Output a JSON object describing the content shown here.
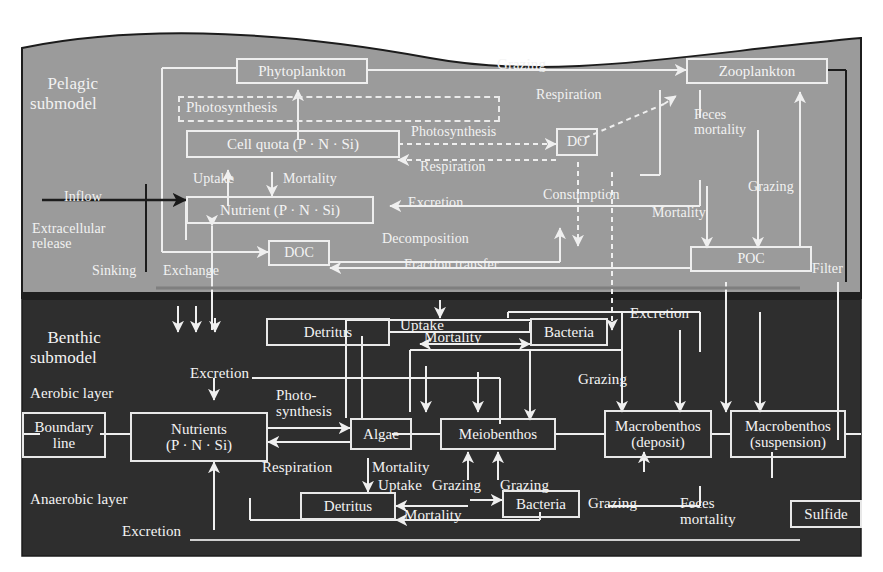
{
  "figure": {
    "type": "ecosystem-box-and-arrow-diagram",
    "background_color": "#ffffff",
    "pelagic_fill": "#999999",
    "benthic_fill": "#2e2e2e",
    "line_color": "#eeeeee"
  },
  "sections": {
    "pelagic": {
      "title": "Pelagic\nsubmodel"
    },
    "benthic": {
      "title": "Benthic\nsubmodel"
    },
    "aerobic": {
      "label": "Aerobic layer"
    },
    "anaerobic": {
      "label": "Anaerobic layer"
    }
  },
  "pelagic": {
    "boxes": {
      "phytoplankton": "Phytoplankton",
      "cell_quota": "Cell quota (P · N · Si)",
      "nutrient": "Nutrient (P · N · Si)",
      "zooplankton": "Zooplankton",
      "do": "DO",
      "doc": "DOC",
      "poc": "POC"
    },
    "dashed_box_label": "Photosynthesis",
    "flows": {
      "grazing": "Grazing",
      "respiration_top": "Respiration",
      "photosynthesis_mid": "Photosynthesis",
      "respiration_mid": "Respiration",
      "uptake": "Uptake",
      "mortality_top": "Mortality",
      "inflow": "Inflow",
      "extracellular_release": "Extracellular\nrelease",
      "sinking": "Sinking",
      "exchange": "Exchange",
      "excretion": "Excretion",
      "consumption": "Consumption",
      "feces_mortality": "Feces\nmortality",
      "grazing_right": "Grazing",
      "mortality_right": "Mortality",
      "decomposition": "Decomposition",
      "fraction_transfer": "Fraction transfer",
      "filter": "Filter"
    }
  },
  "benthic": {
    "boxes": {
      "detritus_upper": "Detritus",
      "bacteria_upper": "Bacteria",
      "boundary_line": "Boundary\nline",
      "nutrients": "Nutrients\n(P · N · Si)",
      "algae": "Algae",
      "meiobenthos": "Meiobenthos",
      "macrobenthos_deposit": "Macrobenthos\n(deposit)",
      "macrobenthos_suspension": "Macrobenthos\n(suspension)",
      "detritus_lower": "Detritus",
      "bacteria_lower": "Bacteria",
      "sulfide": "Sulfide"
    },
    "flows": {
      "uptake_upper": "Uptake",
      "mortality_upper": "Mortality",
      "excretion_upper_right": "Excretion",
      "excretion_mid": "Excretion",
      "photosynthesis": "Photo-\nsynthesis",
      "grazing_bacteria": "Grazing",
      "respiration": "Respiration",
      "mortality_algae": "Mortality",
      "uptake_lower": "Uptake",
      "grazing_meio_left": "Grazing",
      "grazing_meio_right": "Grazing",
      "grazing_bact_right": "Grazing",
      "mortality_lower": "Mortality",
      "feces_mortality": "Feces\nmortality",
      "excretion_lower": "Excretion"
    }
  }
}
